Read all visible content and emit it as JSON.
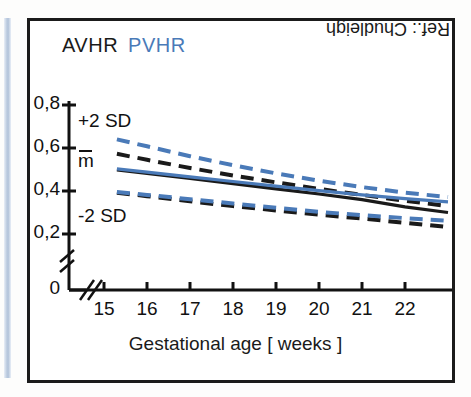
{
  "figure": {
    "legend": {
      "series_a": "AVHR",
      "series_b": "PVHR"
    },
    "reference_note": "Ref.: Chudleigh",
    "annotations": {
      "upper_band": "+2 SD",
      "mean": "m",
      "lower_band": "-2 SD"
    },
    "colors": {
      "avhr": "#1a1a1a",
      "pvhr": "#4a7ab8",
      "frame": "#1b1b1b",
      "stripe": "#aec0d8",
      "background": "#ffffff"
    }
  },
  "chart_data": {
    "type": "line",
    "title": "",
    "xlabel": "Gestational age [ weeks ]",
    "ylabel": "",
    "xlim": [
      15,
      23
    ],
    "ylim": [
      0.2,
      0.8
    ],
    "y_axis_break": true,
    "x_axis_break": true,
    "grid": false,
    "legend_position": "top-left",
    "xticks": [
      15,
      16,
      17,
      18,
      19,
      20,
      21,
      22
    ],
    "xticklabels": [
      "15",
      "16",
      "17",
      "18",
      "19",
      "20",
      "21",
      "22"
    ],
    "yticks": [
      0,
      0.2,
      0.4,
      0.6,
      0.8
    ],
    "yticklabels": [
      "0",
      "0,2",
      "0,4",
      "0,6",
      "0,8"
    ],
    "x": [
      15.3,
      16,
      17,
      18,
      19,
      20,
      21,
      22,
      23
    ],
    "series": [
      {
        "name": "AVHR +2 SD",
        "group": "AVHR",
        "band": "+2SD",
        "color": "#1a1a1a",
        "style": "dashed",
        "values": [
          0.573,
          0.545,
          0.507,
          0.472,
          0.44,
          0.41,
          0.382,
          0.355,
          0.33
        ]
      },
      {
        "name": "AVHR mean",
        "group": "AVHR",
        "band": "mean",
        "color": "#1a1a1a",
        "style": "solid",
        "values": [
          0.498,
          0.482,
          0.458,
          0.434,
          0.41,
          0.386,
          0.36,
          0.326,
          0.3
        ]
      },
      {
        "name": "AVHR -2 SD",
        "group": "AVHR",
        "band": "-2SD",
        "color": "#1a1a1a",
        "style": "dashed",
        "values": [
          0.392,
          0.376,
          0.352,
          0.33,
          0.31,
          0.29,
          0.272,
          0.252,
          0.232
        ]
      },
      {
        "name": "PVHR +2 SD",
        "group": "PVHR",
        "band": "+2SD",
        "color": "#4a7ab8",
        "style": "dashed",
        "values": [
          0.64,
          0.608,
          0.562,
          0.52,
          0.482,
          0.448,
          0.418,
          0.392,
          0.372
        ]
      },
      {
        "name": "PVHR mean",
        "group": "PVHR",
        "band": "mean",
        "color": "#4a7ab8",
        "style": "solid",
        "values": [
          0.503,
          0.488,
          0.466,
          0.444,
          0.423,
          0.402,
          0.382,
          0.364,
          0.35
        ]
      },
      {
        "name": "PVHR -2 SD",
        "group": "PVHR",
        "band": "-2SD",
        "color": "#4a7ab8",
        "style": "dashed",
        "values": [
          0.395,
          0.382,
          0.362,
          0.342,
          0.322,
          0.303,
          0.288,
          0.274,
          0.262
        ]
      }
    ]
  }
}
